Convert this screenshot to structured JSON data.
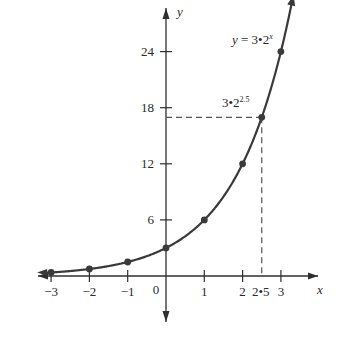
{
  "chart_data": {
    "type": "line",
    "title": "",
    "equation_label": "y = 3•2ˣ",
    "equation_parts": {
      "lhs": "y",
      "eq": "=",
      "rhs_base": "3•2",
      "rhs_exp": "x"
    },
    "xlabel": "x",
    "ylabel": "y",
    "x_ticks": [
      -3,
      -2,
      -1,
      0,
      1,
      2,
      3
    ],
    "x_tick_labels": [
      "−3",
      "−2",
      "−1",
      "0",
      "1",
      "2",
      "3"
    ],
    "y_ticks": [
      6,
      12,
      18,
      24
    ],
    "y_tick_labels": [
      "6",
      "12",
      "18",
      "24"
    ],
    "xlim": [
      -3.2,
      3.6
    ],
    "ylim": [
      -5,
      27
    ],
    "grid": false,
    "series": [
      {
        "name": "y = 3•2^x",
        "function": "3*2^x",
        "points": [
          {
            "x": -3,
            "y": 0.375
          },
          {
            "x": -2,
            "y": 0.75
          },
          {
            "x": -1,
            "y": 1.5
          },
          {
            "x": 0,
            "y": 3
          },
          {
            "x": 1,
            "y": 6
          },
          {
            "x": 2,
            "y": 12
          },
          {
            "x": 2.5,
            "y": 16.97
          },
          {
            "x": 3,
            "y": 24
          }
        ]
      }
    ],
    "annotations": [
      {
        "text": "3•2^2.5",
        "base": "3•2",
        "exp": "2.5",
        "x": 2.5,
        "y": 16.97,
        "type": "dashed-guides"
      },
      {
        "text": "2.5",
        "x": 2.5,
        "type": "x-marker-label",
        "display": "2•5"
      }
    ]
  },
  "labels": {
    "x_axis": "x",
    "y_axis": "y",
    "origin": "0",
    "marker_x": "2•5"
  }
}
